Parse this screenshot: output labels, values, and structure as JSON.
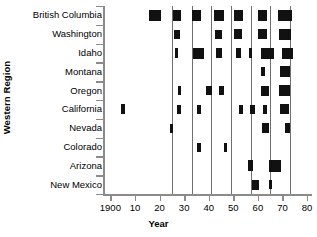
{
  "chart_data": {
    "type": "scatter",
    "title": "",
    "xlabel": "Year",
    "ylabel": "Western Region",
    "xlim": [
      1897,
      1882
    ],
    "xtick_labels": [
      "1900",
      "10",
      "20",
      "30",
      "40",
      "50",
      "60",
      "70",
      "80"
    ],
    "xtick_values": [
      1900,
      1910,
      1920,
      1930,
      1940,
      1950,
      1960,
      1970,
      1980
    ],
    "grid": "vertical gridlines at decade-ish intervals",
    "gridline_values": [
      1925,
      1933,
      1941,
      1949,
      1957,
      1965,
      1973
    ],
    "legend": "none",
    "marker_note": "filled black rectangles; area/size indicates magnitude of event",
    "categories": [
      "British Columbia",
      "Washington",
      "Idaho",
      "Montana",
      "Oregon",
      "California",
      "Nevada",
      "Colorado",
      "Arizona",
      "New Mexico"
    ],
    "series": [
      {
        "name": "British Columbia",
        "points": [
          {
            "x": 1918,
            "w": 12,
            "h": 11
          },
          {
            "x": 1927,
            "w": 8,
            "h": 11
          },
          {
            "x": 1935,
            "w": 9,
            "h": 11
          },
          {
            "x": 1944,
            "w": 10,
            "h": 11
          },
          {
            "x": 1952,
            "w": 9,
            "h": 11
          },
          {
            "x": 1962,
            "w": 9,
            "h": 11
          },
          {
            "x": 1971,
            "w": 14,
            "h": 11
          }
        ]
      },
      {
        "name": "Washington",
        "points": [
          {
            "x": 1927,
            "w": 6,
            "h": 9
          },
          {
            "x": 1944,
            "w": 7,
            "h": 9
          },
          {
            "x": 1952,
            "w": 8,
            "h": 10
          },
          {
            "x": 1962,
            "w": 9,
            "h": 10
          },
          {
            "x": 1971,
            "w": 12,
            "h": 11
          }
        ]
      },
      {
        "name": "Idaho",
        "points": [
          {
            "x": 1927,
            "w": 3,
            "h": 10
          },
          {
            "x": 1936,
            "w": 11,
            "h": 11
          },
          {
            "x": 1944,
            "w": 6,
            "h": 10
          },
          {
            "x": 1952,
            "w": 5,
            "h": 10
          },
          {
            "x": 1957,
            "w": 3,
            "h": 10
          },
          {
            "x": 1964,
            "w": 13,
            "h": 11
          },
          {
            "x": 1972,
            "w": 11,
            "h": 11
          }
        ]
      },
      {
        "name": "Montana",
        "points": [
          {
            "x": 1962,
            "w": 4,
            "h": 9
          },
          {
            "x": 1971,
            "w": 10,
            "h": 11
          }
        ]
      },
      {
        "name": "Oregon",
        "points": [
          {
            "x": 1928,
            "w": 3,
            "h": 9
          },
          {
            "x": 1940,
            "w": 6,
            "h": 9
          },
          {
            "x": 1945,
            "w": 5,
            "h": 9
          },
          {
            "x": 1963,
            "w": 8,
            "h": 10
          },
          {
            "x": 1971,
            "w": 11,
            "h": 11
          }
        ]
      },
      {
        "name": "California",
        "points": [
          {
            "x": 1905,
            "w": 4,
            "h": 10
          },
          {
            "x": 1928,
            "w": 4,
            "h": 9
          },
          {
            "x": 1936,
            "w": 4,
            "h": 9
          },
          {
            "x": 1953,
            "w": 4,
            "h": 9
          },
          {
            "x": 1958,
            "w": 5,
            "h": 9
          },
          {
            "x": 1963,
            "w": 4,
            "h": 9
          },
          {
            "x": 1971,
            "w": 9,
            "h": 10
          }
        ]
      },
      {
        "name": "Nevada",
        "points": [
          {
            "x": 1925,
            "w": 3,
            "h": 9
          },
          {
            "x": 1963,
            "w": 7,
            "h": 10
          },
          {
            "x": 1972,
            "w": 5,
            "h": 10
          }
        ]
      },
      {
        "name": "Colorado",
        "points": [
          {
            "x": 1936,
            "w": 4,
            "h": 9
          },
          {
            "x": 1947,
            "w": 3,
            "h": 9
          }
        ]
      },
      {
        "name": "Arizona",
        "points": [
          {
            "x": 1957,
            "w": 5,
            "h": 11
          },
          {
            "x": 1967,
            "w": 12,
            "h": 12
          }
        ]
      },
      {
        "name": "New Mexico",
        "points": [
          {
            "x": 1959,
            "w": 7,
            "h": 10
          },
          {
            "x": 1965,
            "w": 3,
            "h": 9
          }
        ]
      }
    ]
  }
}
